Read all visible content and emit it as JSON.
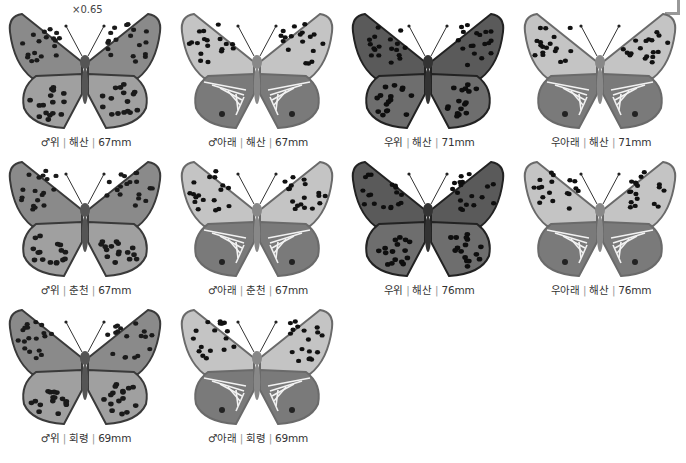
{
  "scale_label": "×0.65",
  "specimens": [
    {
      "sex": "♂",
      "side": "위",
      "locality": "해산",
      "size": "67mm",
      "view": "upper",
      "tone": "mid"
    },
    {
      "sex": "♂",
      "side": "아래",
      "locality": "해산",
      "size": "67mm",
      "view": "under",
      "tone": "light"
    },
    {
      "sex": "우",
      "side": "위",
      "locality": "해산",
      "size": "71mm",
      "view": "upper",
      "tone": "dark"
    },
    {
      "sex": "우",
      "side": "아래",
      "locality": "해산",
      "size": "71mm",
      "view": "under",
      "tone": "light"
    },
    {
      "sex": "♂",
      "side": "위",
      "locality": "춘천",
      "size": "67mm",
      "view": "upper",
      "tone": "mid"
    },
    {
      "sex": "♂",
      "side": "아래",
      "locality": "춘천",
      "size": "67mm",
      "view": "under",
      "tone": "light"
    },
    {
      "sex": "우",
      "side": "위",
      "locality": "해산",
      "size": "76mm",
      "view": "upper",
      "tone": "dark"
    },
    {
      "sex": "우",
      "side": "아래",
      "locality": "해산",
      "size": "76mm",
      "view": "under",
      "tone": "light"
    },
    {
      "sex": "♂",
      "side": "위",
      "locality": "회령",
      "size": "69mm",
      "view": "upper",
      "tone": "mid"
    },
    {
      "sex": "♂",
      "side": "아래",
      "locality": "회령",
      "size": "69mm",
      "view": "under",
      "tone": "light"
    }
  ],
  "colors": {
    "caption_text": "#333333",
    "separator": "#999999",
    "background": "#ffffff"
  }
}
